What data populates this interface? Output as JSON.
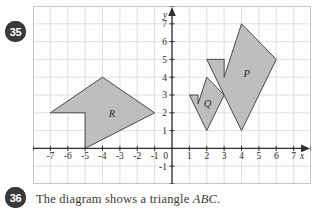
{
  "page": {
    "background_color": "#fdfdfc"
  },
  "questions": [
    {
      "number": "35",
      "text": ""
    },
    {
      "number": "36",
      "text_before": "The diagram shows a triangle ",
      "text_italic": "ABC",
      "text_after": "."
    }
  ],
  "chart_data": {
    "type": "diagram",
    "title": "",
    "xlabel": "x",
    "ylabel": "y",
    "grid": true,
    "xlim": [
      -8,
      8
    ],
    "ylim": [
      -2,
      8
    ],
    "x_ticks": [
      "-7",
      "-6",
      "-5",
      "-4",
      "-3",
      "-2",
      "-1",
      "0",
      "1",
      "2",
      "3",
      "4",
      "5",
      "6",
      "7"
    ],
    "y_ticks": [
      "-1",
      "1",
      "2",
      "3",
      "4",
      "5",
      "6",
      "7"
    ],
    "origin_label": "0",
    "colors": {
      "shape_fill": "#b3b3b3",
      "shape_stroke": "#4a4a4a",
      "grid": "#c9cdd4",
      "axis": "#2e2e2e",
      "badge": "#3a3a3a"
    },
    "shapes": [
      {
        "label": "P",
        "label_at": [
          4.3,
          4.0
        ],
        "points": [
          [
            4,
            7
          ],
          [
            6,
            5
          ],
          [
            4,
            1
          ],
          [
            2,
            5
          ],
          [
            3,
            5
          ],
          [
            3,
            4
          ]
        ]
      },
      {
        "label": "Q",
        "label_at": [
          2.05,
          2.3
        ],
        "points": [
          [
            2,
            4
          ],
          [
            3,
            3
          ],
          [
            2,
            1
          ],
          [
            1,
            3
          ],
          [
            1.5,
            3
          ],
          [
            1.5,
            2.5
          ]
        ]
      },
      {
        "label": "R",
        "label_at": [
          -3.45,
          1.75
        ],
        "points": [
          [
            -7,
            2
          ],
          [
            -4,
            4
          ],
          [
            -1,
            2
          ],
          [
            -5,
            0
          ],
          [
            -5,
            2
          ]
        ]
      }
    ]
  }
}
